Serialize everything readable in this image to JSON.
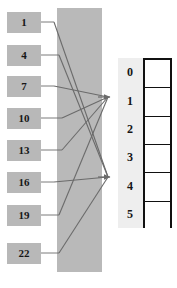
{
  "diagram": {
    "type": "hash-table-mapping",
    "colors": {
      "key_box_fill": "#b8b8b8",
      "hash_band_fill": "#b9b9b9",
      "slot_band_fill": "#eeeeee",
      "edge_stroke": "#6b6b6b",
      "table_border": "#111111",
      "cell_fill": "#ffffff",
      "text": "#161616",
      "background": "#ffffff"
    },
    "keys": [
      {
        "label": "1",
        "x": 7,
        "y": 12,
        "target_slot": "4"
      },
      {
        "label": "4",
        "x": 7,
        "y": 45,
        "target_slot": "4"
      },
      {
        "label": "7",
        "x": 7,
        "y": 76,
        "target_slot": "1"
      },
      {
        "label": "10",
        "x": 7,
        "y": 108,
        "target_slot": "1"
      },
      {
        "label": "13",
        "x": 7,
        "y": 140,
        "target_slot": "1"
      },
      {
        "label": "16",
        "x": 7,
        "y": 172,
        "target_slot": "4"
      },
      {
        "label": "19",
        "x": 7,
        "y": 205,
        "target_slot": "1"
      },
      {
        "label": "22",
        "x": 7,
        "y": 243,
        "target_slot": "4"
      }
    ],
    "hash_band": {
      "x": 57,
      "y": 8,
      "width": 45,
      "height": 264
    },
    "slot_band": {
      "x": 118,
      "y": 58,
      "width": 25,
      "height": 170
    },
    "arrow_targets": [
      {
        "slot": "1",
        "x": 110,
        "y": 97
      },
      {
        "slot": "4",
        "x": 110,
        "y": 177
      }
    ],
    "slots": [
      {
        "index": "0",
        "value": ""
      },
      {
        "index": "1",
        "value": ""
      },
      {
        "index": "2",
        "value": ""
      },
      {
        "index": "3",
        "value": ""
      },
      {
        "index": "4",
        "value": ""
      },
      {
        "index": "5",
        "value": ""
      }
    ],
    "edges": [
      {
        "from_key": "1",
        "to_slot": "4",
        "stub_x": 54,
        "from_y": 22,
        "to_x": 108,
        "to_y": 177
      },
      {
        "from_key": "4",
        "to_slot": "4",
        "stub_x": 59,
        "from_y": 55,
        "to_x": 108,
        "to_y": 177
      },
      {
        "from_key": "7",
        "to_slot": "1",
        "stub_x": 54,
        "from_y": 86,
        "to_x": 108,
        "to_y": 97
      },
      {
        "from_key": "10",
        "to_slot": "1",
        "stub_x": 62,
        "from_y": 118,
        "to_x": 108,
        "to_y": 97
      },
      {
        "from_key": "13",
        "to_slot": "1",
        "stub_x": 62,
        "from_y": 150,
        "to_x": 108,
        "to_y": 97
      },
      {
        "from_key": "16",
        "to_slot": "4",
        "stub_x": 54,
        "from_y": 182,
        "to_x": 108,
        "to_y": 177
      },
      {
        "from_key": "19",
        "to_slot": "1",
        "stub_x": 59,
        "from_y": 215,
        "to_x": 108,
        "to_y": 97
      },
      {
        "from_key": "22",
        "to_slot": "4",
        "stub_x": 59,
        "from_y": 253,
        "to_x": 108,
        "to_y": 177
      }
    ]
  }
}
